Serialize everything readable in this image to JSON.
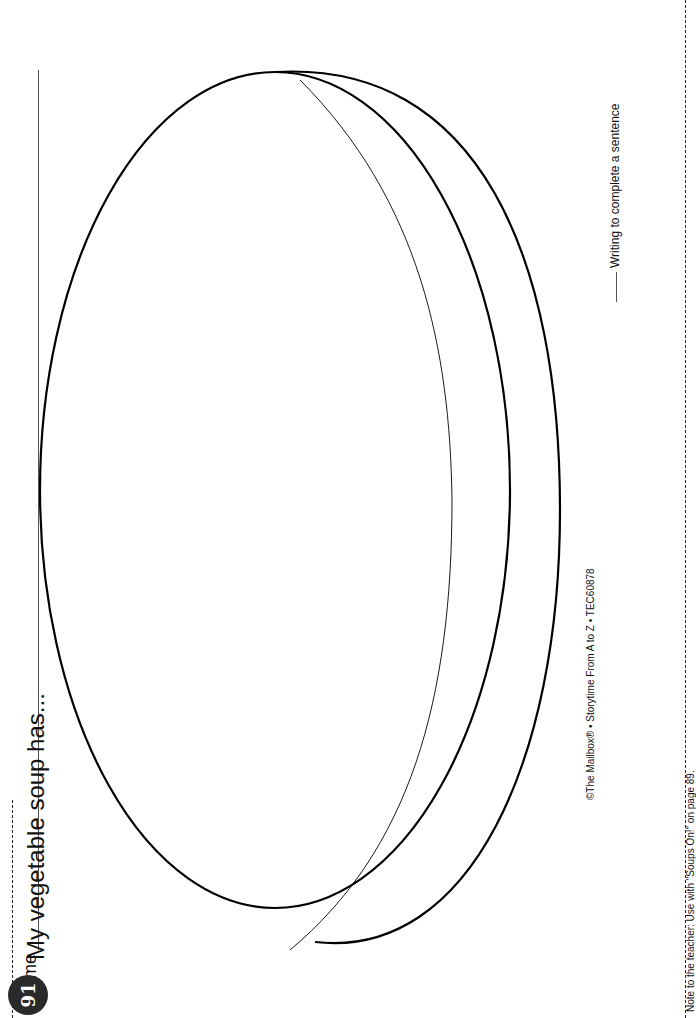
{
  "worksheet": {
    "skill_label": "Writing to complete a sentence",
    "name_label": "Name",
    "prompt": "My vegetable soup has...",
    "copyright": "©The Mailbox® • Storytime From A to Z • TEC60878",
    "note": "Note to the teacher: Use with \"Soups On!\" on page 89.",
    "page_number": "91",
    "illustration": "soup-bowl-outline-icon"
  }
}
